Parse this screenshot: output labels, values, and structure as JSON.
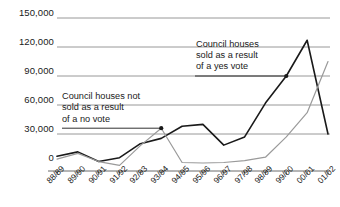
{
  "chart_data": {
    "type": "line",
    "title": "",
    "xlabel": "",
    "ylabel": "",
    "ylim": [
      0,
      150000
    ],
    "grid": true,
    "legend_position": "none",
    "categories": [
      "88/89",
      "89/90",
      "90/91",
      "91/92",
      "92/93",
      "93/94",
      "94/95",
      "95/96",
      "96/97",
      "97/98",
      "98/99",
      "99/00",
      "00/01",
      "01/02"
    ],
    "yticks": [
      "0",
      "30,000",
      "60,000",
      "90,000",
      "120,000",
      "150,000"
    ],
    "ytick_values": [
      0,
      30000,
      60000,
      90000,
      120000,
      150000
    ],
    "series": [
      {
        "name": "Council houses sold as a result of a yes vote",
        "color": "#1a1a1a",
        "values": [
          7000,
          11500,
          1500,
          5500,
          20000,
          25500,
          38000,
          40000,
          18500,
          27000,
          62000,
          90000,
          127000,
          30000
        ]
      },
      {
        "name": "Council houses not sold as a result of a no vote",
        "color": "#9a9a9a",
        "values": [
          4000,
          10000,
          1500,
          -2500,
          18000,
          36000,
          500,
          0,
          500,
          2500,
          6000,
          27000,
          52000,
          105000
        ]
      }
    ],
    "annotations": [
      {
        "id": "no-vote",
        "lines": [
          "Council houses not",
          "sold as a result",
          "of a no vote"
        ],
        "points_to_category": "93/94",
        "points_to_value": 36000
      },
      {
        "id": "yes-vote",
        "lines": [
          "Council houses",
          "sold as a result",
          "of a yes vote"
        ],
        "points_to_category": "99/00",
        "points_to_value": 90000
      }
    ]
  }
}
